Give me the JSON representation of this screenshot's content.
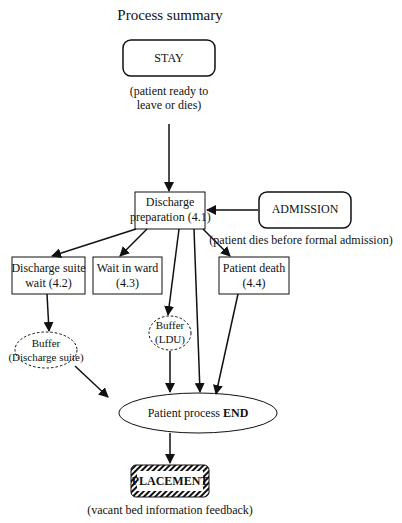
{
  "title": "Process summary",
  "nodes": {
    "stay": {
      "label": "STAY",
      "note_line1": "(patient ready to",
      "note_line2": "leave or dies)"
    },
    "discharge_prep": {
      "line1": "Discharge",
      "line2": "preparation (4.1)"
    },
    "admission": {
      "label": "ADMISSION",
      "note": "(patient dies before formal admission)"
    },
    "discharge_suite_wait": {
      "line1": "Discharge suite",
      "line2": "wait (4.2)"
    },
    "wait_in_ward": {
      "line1": "Wait in ward",
      "line2": "(4.3)"
    },
    "patient_death": {
      "line1": "Patient death",
      "line2": "(4.4)"
    },
    "buffer_discharge": {
      "line1": "Buffer",
      "line2": "(Discharge suite)"
    },
    "buffer_ldu": {
      "line1": "Buffer",
      "line2": "(LDU)"
    },
    "end": {
      "prefix": "Patient process ",
      "bold": "END"
    },
    "placement": {
      "label": "PLACEMENT",
      "note": "(vacant bed information feedback)"
    }
  }
}
